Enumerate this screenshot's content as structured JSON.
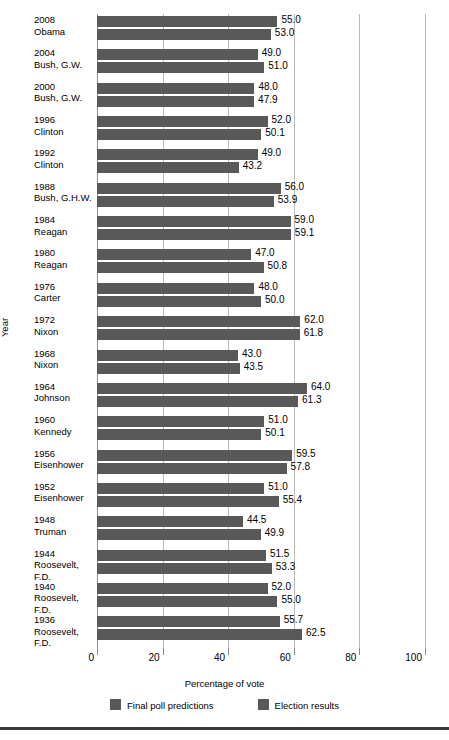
{
  "chart_data": {
    "type": "bar",
    "orientation": "horizontal",
    "title": "",
    "xlabel": "Percentage of vote",
    "ylabel": "Year",
    "xlim": [
      0,
      100
    ],
    "xticks": [
      0,
      20,
      40,
      60,
      80,
      100
    ],
    "xtick_labels": [
      "0",
      "20",
      "40",
      "60",
      "80",
      "100"
    ],
    "grid": true,
    "legend_position": "bottom",
    "bar_color": "#595959",
    "categories": [
      {
        "year": "2008",
        "name": "Obama"
      },
      {
        "year": "2004",
        "name": "Bush, G.W."
      },
      {
        "year": "2000",
        "name": "Bush, G.W."
      },
      {
        "year": "1996",
        "name": "Clinton"
      },
      {
        "year": "1992",
        "name": "Clinton"
      },
      {
        "year": "1988",
        "name": "Bush, G.H.W."
      },
      {
        "year": "1984",
        "name": "Reagan"
      },
      {
        "year": "1980",
        "name": "Reagan"
      },
      {
        "year": "1976",
        "name": "Carter"
      },
      {
        "year": "1972",
        "name": "Nixon"
      },
      {
        "year": "1968",
        "name": "Nixon"
      },
      {
        "year": "1964",
        "name": "Johnson"
      },
      {
        "year": "1960",
        "name": "Kennedy"
      },
      {
        "year": "1956",
        "name": "Eisenhower"
      },
      {
        "year": "1952",
        "name": "Eisenhower"
      },
      {
        "year": "1948",
        "name": "Truman"
      },
      {
        "year": "1944",
        "name": "Roosevelt, F.D."
      },
      {
        "year": "1940",
        "name": "Roosevelt, F.D."
      },
      {
        "year": "1936",
        "name": "Roosevelt, F.D."
      }
    ],
    "series": [
      {
        "name": "Final poll predictions",
        "values": [
          55.0,
          49.0,
          48.0,
          52.0,
          49.0,
          56.0,
          59.0,
          47.0,
          48.0,
          62.0,
          43.0,
          64.0,
          51.0,
          59.5,
          51.0,
          44.5,
          51.5,
          52.0,
          55.7
        ],
        "labels": [
          "55.0",
          "49.0",
          "48.0",
          "52.0",
          "49.0",
          "56.0",
          "59.0",
          "47.0",
          "48.0",
          "62.0",
          "43.0",
          "64.0",
          "51.0",
          "59.5",
          "51.0",
          "44.5",
          "51.5",
          "52.0",
          "55.7"
        ]
      },
      {
        "name": "Election results",
        "values": [
          53.0,
          51.0,
          47.9,
          50.1,
          43.2,
          53.9,
          59.1,
          50.8,
          50.0,
          61.8,
          43.5,
          61.3,
          50.1,
          57.8,
          55.4,
          49.9,
          53.3,
          55.0,
          62.5
        ],
        "labels": [
          "53.0",
          "51.0",
          "47.9",
          "50.1",
          "43.2",
          "53.9",
          "59.1",
          "50.8",
          "50.0",
          "61.8",
          "43.5",
          "61.3",
          "50.1",
          "57.8",
          "55.4",
          "49.9",
          "53.3",
          "55.0",
          "62.5"
        ]
      }
    ]
  },
  "legend": {
    "items": [
      {
        "label": "Final poll predictions",
        "color": "#595959"
      },
      {
        "label": "Election results",
        "color": "#595959"
      }
    ]
  },
  "axis": {
    "x_title": "Percentage of vote",
    "y_title": "Year"
  }
}
